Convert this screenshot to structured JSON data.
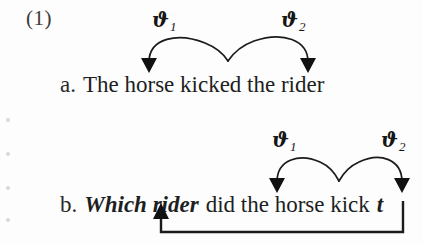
{
  "figure": {
    "example_number": "(1)",
    "background_color": "#fdfdfd",
    "ink_color": "#1b1b1b"
  },
  "line_a": {
    "tag": "a.",
    "text": "The horse kicked the rider",
    "full": "a.  The horse kicked the rider",
    "theta_labels": [
      {
        "glyph": "ϑ",
        "subscript": "1",
        "name": "theta-1"
      },
      {
        "glyph": "ϑ",
        "subscript": "2",
        "name": "theta-2"
      }
    ]
  },
  "line_b": {
    "tag": "b.",
    "wh_phrase": "Which rider",
    "middle": "did the horse kick",
    "trace": "t",
    "full": "b.  Which rider did the horse kick t",
    "theta_labels": [
      {
        "glyph": "ϑ",
        "subscript": "1",
        "name": "theta-1"
      },
      {
        "glyph": "ϑ",
        "subscript": "2",
        "name": "theta-2"
      }
    ]
  },
  "annotations": {
    "theta_arc_label": "theta-role assignment arc",
    "movement_arrow_label": "wh-movement arrow"
  }
}
